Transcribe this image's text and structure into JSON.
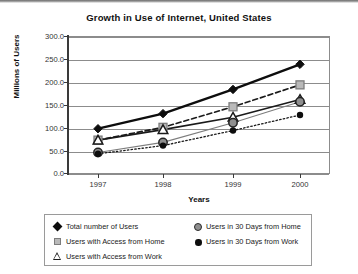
{
  "chart_data": {
    "type": "line",
    "title": "Growth in Use of Internet, United States",
    "xlabel": "Years",
    "ylabel": "Millions of Users",
    "categories": [
      "1997",
      "1998",
      "1999",
      "2000"
    ],
    "x_tick_labels": [
      "1997",
      "1998",
      "1999",
      "2000"
    ],
    "y_tick_labels": [
      "300.0",
      "250.0",
      "200.0",
      "150.0",
      "100.0",
      "50.0",
      "0.0"
    ],
    "y_tick_values": [
      300,
      250,
      200,
      150,
      100,
      50,
      0
    ],
    "ylim": [
      0,
      300
    ],
    "grid": "horizontal",
    "legend_position": "bottom",
    "series": [
      {
        "name": "Total number of Users",
        "marker": "filled-diamond",
        "line": "solid-thick",
        "color": "#0d0d0d",
        "values": [
          97,
          130,
          183,
          238
        ]
      },
      {
        "name": "Users with Access from Home",
        "marker": "gray-square",
        "line": "dashed",
        "color": "#b9b9b9",
        "values": [
          72,
          100,
          145,
          193
        ]
      },
      {
        "name": "Users with Access from Work",
        "marker": "open-triangle",
        "line": "solid",
        "color": "#1a1a1a",
        "values": [
          72,
          95,
          122,
          161
        ]
      },
      {
        "name": "Users in 30 Days from Home",
        "marker": "gray-circle",
        "line": "thin-solid",
        "color": "#8f8f8f",
        "values": [
          45,
          67,
          110,
          156
        ]
      },
      {
        "name": "Users in 30 Days from Work",
        "marker": "small-filled-circle",
        "line": "dotted",
        "color": "#0d0d0d",
        "values": [
          42,
          60,
          93,
          127
        ]
      }
    ]
  },
  "legend": {
    "left_column": [
      "Total number of Users",
      "Users with Access from Home",
      "Users with Access from Work"
    ],
    "right_column": [
      "Users in 30 Days from Home",
      "Users in 30 Days from Work"
    ]
  }
}
